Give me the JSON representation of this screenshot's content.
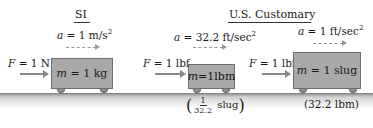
{
  "headers": {
    "si": "SI",
    "us": "U.S. Customary"
  },
  "panels": [
    {
      "system": "SI",
      "force_label": "F = 1 N",
      "force_symbol": "F",
      "force_value": "= 1 N",
      "accel_symbol": "a",
      "accel_value": "= 1 m/s",
      "accel_exp": "2",
      "mass_symbol": "m",
      "mass_value": "= 1 kg"
    },
    {
      "system": "U.S. Customary",
      "force_symbol": "F",
      "force_value": "= 1 lbf",
      "accel_symbol": "a",
      "accel_value": "= 32.2 ft/sec",
      "accel_exp": "2",
      "mass_symbol": "m",
      "mass_value": "=1lbm",
      "equiv_num": "1",
      "equiv_den": "32.2",
      "equiv_unit": "slug"
    },
    {
      "system": "U.S. Customary",
      "force_symbol": "F",
      "force_value": "= 1 lbf",
      "accel_symbol": "a",
      "accel_value": "= 1 ft/sec",
      "accel_exp": "2",
      "mass_symbol": "m",
      "mass_value": "= 1 slug",
      "equiv_text": "(32.2 lbm)"
    }
  ],
  "colors": {
    "box_fill": "#a9a9a9",
    "box_border": "#6e6e6e",
    "arrow": "#888888",
    "text": "#1a1a1a"
  }
}
